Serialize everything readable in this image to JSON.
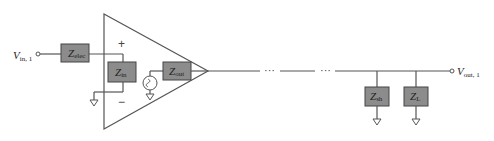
{
  "input": {
    "label": "V",
    "sub": "in, 1"
  },
  "output": {
    "label": "V",
    "sub": "out, 1"
  },
  "impedances": [
    {
      "id": "zelec",
      "label": "Z",
      "sub": "elec"
    },
    {
      "id": "zin",
      "label": "Z",
      "sub": "in"
    },
    {
      "id": "zout",
      "label": "Z",
      "sub": "out"
    },
    {
      "id": "zsh",
      "label": "Z",
      "sub": "sh"
    },
    {
      "id": "zl",
      "label": "Z",
      "sub": "L"
    }
  ],
  "amp": {
    "plus": "+",
    "minus": "−"
  },
  "ellipsis": [
    "···",
    "···"
  ]
}
